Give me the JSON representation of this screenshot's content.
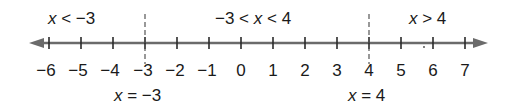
{
  "number_line": {
    "min": -6,
    "max": 7,
    "ticks": [
      "−6",
      "−5",
      "−4",
      "−3",
      "−2",
      "−1",
      "0",
      "1",
      "2",
      "3",
      "4",
      "5",
      "6",
      "7"
    ],
    "axis_color": "#6b6b6b",
    "text_color": "#1a1a1a",
    "arrows": "both"
  },
  "regions": [
    {
      "var": "x",
      "label_pre": "",
      "label_post": " < −3"
    },
    {
      "var": "x",
      "label_pre": "−3 < ",
      "label_post": " < 4"
    },
    {
      "var": "x",
      "label_pre": "",
      "label_post": " > 4"
    }
  ],
  "boundaries": [
    {
      "value": -3,
      "var": "x",
      "label_post": " = −3"
    },
    {
      "value": 4,
      "var": "x",
      "label_post": " = 4"
    }
  ]
}
